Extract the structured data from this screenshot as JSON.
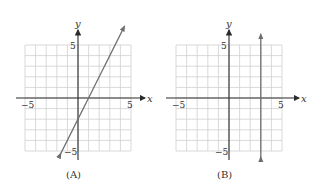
{
  "chart_data": [
    {
      "type": "line",
      "caption": "(A)",
      "xlabel": "x",
      "ylabel": "y",
      "xlim": [
        -5,
        5
      ],
      "ylim": [
        -5,
        5
      ],
      "grid": true,
      "x_tick_labels": [
        "-5",
        "5"
      ],
      "y_tick_labels": [
        "5",
        "-5"
      ],
      "series": [
        {
          "name": "line",
          "equation": "y = 2x - 2",
          "x": [
            -1.7,
            4.3
          ],
          "y": [
            -5.4,
            6.6
          ]
        }
      ]
    },
    {
      "type": "line",
      "caption": "(B)",
      "xlabel": "x",
      "ylabel": "y",
      "xlim": [
        -5,
        5
      ],
      "ylim": [
        -5,
        5
      ],
      "grid": true,
      "x_tick_labels": [
        "-5",
        "5"
      ],
      "y_tick_labels": [
        "5",
        "-5"
      ],
      "series": [
        {
          "name": "line",
          "equation": "x = 3",
          "x": [
            3,
            3
          ],
          "y": [
            -5.8,
            5.8
          ]
        }
      ]
    }
  ],
  "graphs": {
    "a": {
      "caption": "(A)",
      "xlabel": "x",
      "ylabel": "y",
      "xmin_label": "−5",
      "xmax_label": "5",
      "ymax_label": "5",
      "ymin_label": "−5"
    },
    "b": {
      "caption": "(B)",
      "xlabel": "x",
      "ylabel": "y",
      "xmin_label": "−5",
      "xmax_label": "5",
      "ymax_label": "5",
      "ymin_label": "−5"
    }
  }
}
